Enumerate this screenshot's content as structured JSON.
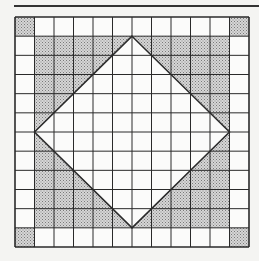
{
  "diagram": {
    "type": "grid-diamond-puzzle",
    "grid": {
      "rows": 12,
      "cols": 12,
      "left": 15,
      "top": 17,
      "right": 249,
      "bottom": 247
    },
    "shaded_corner_cells": [
      [
        0,
        0
      ],
      [
        0,
        11
      ],
      [
        11,
        0
      ],
      [
        11,
        11
      ]
    ],
    "inner_square": {
      "row_start": 1,
      "row_end": 11,
      "col_start": 1,
      "col_end": 11
    },
    "diamond_vertices_gridlines": [
      [
        6,
        1
      ],
      [
        11,
        6
      ],
      [
        6,
        11
      ],
      [
        1,
        6
      ]
    ],
    "shaded_regions": "four corner triangles of inner square outside diamond, plus four corner cells",
    "colors": {
      "line": "#2a2a2a",
      "shade": "#bdbdbd",
      "background": "#f4f4f2",
      "cell": "#fbfbfa"
    }
  }
}
